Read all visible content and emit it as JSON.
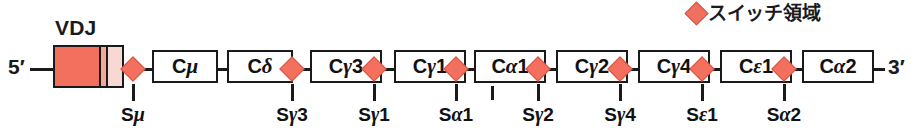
{
  "diagram": {
    "title_vdj": "VDJ",
    "end_labels": {
      "five_prime": "5′",
      "three_prime": "3′"
    },
    "legend": {
      "symbol": "switch-region-diamond",
      "label": "スイッチ領域"
    },
    "colors": {
      "switch_diamond": "#f4705e",
      "switch_diamond_border": "#d9523f",
      "vdj_v_segment": "#f4705e",
      "vdj_d_segment": "#f2a89c",
      "vdj_j_segment": "#f8d8d2",
      "line": "#1a1a1a",
      "box_fill": "#ffffff",
      "text": "#111111"
    },
    "vdj_segments": [
      {
        "name": "V",
        "color": "#f4705e",
        "width": 44
      },
      {
        "name": "D",
        "color": "#f2a89c",
        "width": 7
      },
      {
        "name": "J",
        "color": "#f8d8d2",
        "width": 16
      }
    ],
    "genes": [
      {
        "id": "cmu",
        "prefix": "C",
        "greek": "μ",
        "suffix": "",
        "label": "Cμ",
        "x": 152,
        "width": 66
      },
      {
        "id": "cdelta",
        "prefix": "C",
        "greek": "δ",
        "suffix": "",
        "label": "Cδ",
        "x": 227,
        "width": 66
      },
      {
        "id": "cgamma3",
        "prefix": "C",
        "greek": "γ",
        "suffix": "3",
        "label": "Cγ3",
        "x": 310,
        "width": 72
      },
      {
        "id": "cgamma1",
        "prefix": "C",
        "greek": "γ",
        "suffix": "1",
        "label": "Cγ1",
        "x": 394,
        "width": 72
      },
      {
        "id": "calpha1",
        "prefix": "C",
        "greek": "α",
        "suffix": "1",
        "label": "Cα1",
        "x": 474,
        "width": 72
      },
      {
        "id": "cgamma2",
        "prefix": "C",
        "greek": "γ",
        "suffix": "2",
        "label": "Cγ2",
        "x": 556,
        "width": 72
      },
      {
        "id": "cgamma4",
        "prefix": "C",
        "greek": "γ",
        "suffix": "4",
        "label": "Cγ4",
        "x": 638,
        "width": 72
      },
      {
        "id": "cepsilon1",
        "prefix": "C",
        "greek": "ε",
        "suffix": "1",
        "label": "Cε1",
        "x": 720,
        "width": 72
      },
      {
        "id": "calpha2",
        "prefix": "C",
        "greek": "α",
        "suffix": "2",
        "label": "Cα2",
        "x": 802,
        "width": 72
      }
    ],
    "switch_regions": [
      {
        "id": "smu",
        "label": "Sμ",
        "prefix": "S",
        "greek": "μ",
        "suffix": "",
        "x": 133,
        "has_tick": true
      },
      {
        "id": "sgamma3",
        "label": "Sγ3",
        "prefix": "S",
        "greek": "γ",
        "suffix": "3",
        "x": 292,
        "has_tick": true
      },
      {
        "id": "sgamma1",
        "label": "Sγ1",
        "prefix": "S",
        "greek": "γ",
        "suffix": "1",
        "x": 374,
        "has_tick": true
      },
      {
        "id": "salpha1",
        "label": "Sα1",
        "prefix": "S",
        "greek": "α",
        "suffix": "1",
        "x": 456,
        "has_tick": true
      },
      {
        "id": "sgamma2",
        "label": "Sγ2",
        "prefix": "S",
        "greek": "γ",
        "suffix": "2",
        "x": 538,
        "has_tick": true
      },
      {
        "id": "sgamma4",
        "label": "Sγ4",
        "prefix": "S",
        "greek": "γ",
        "suffix": "4",
        "x": 620,
        "has_tick": true
      },
      {
        "id": "sepsilon1",
        "label": "Sε1",
        "prefix": "S",
        "greek": "ε",
        "suffix": "1",
        "x": 702,
        "has_tick": true
      },
      {
        "id": "salpha2",
        "label": "Sα2",
        "prefix": "S",
        "greek": "α",
        "suffix": "2",
        "x": 784,
        "has_tick": true
      }
    ],
    "extra_tick": {
      "id": "calpha1-marker",
      "x": 492
    }
  }
}
